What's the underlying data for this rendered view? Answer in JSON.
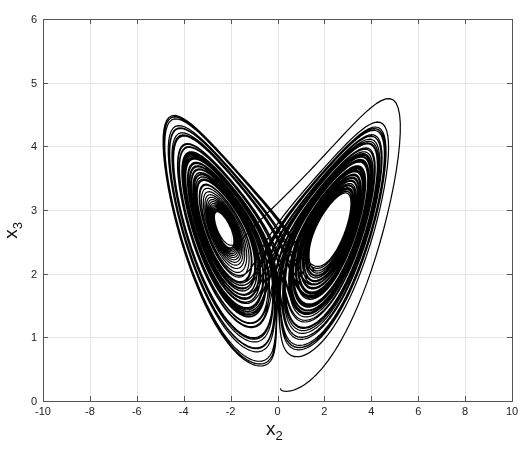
{
  "chart_data": {
    "type": "line",
    "title": "",
    "xlabel": "x",
    "xlabel_sub": "2",
    "ylabel": "x",
    "ylabel_sub": "3",
    "xlim": [
      -10,
      10
    ],
    "ylim": [
      0,
      6
    ],
    "xticks": [
      "-10",
      "-8",
      "-6",
      "-4",
      "-2",
      "0",
      "2",
      "4",
      "6",
      "8",
      "10"
    ],
    "yticks": [
      "0",
      "1",
      "2",
      "3",
      "4",
      "5",
      "6"
    ],
    "grid": true,
    "legend": null,
    "series": [
      {
        "name": "chaotic attractor trajectory (x2 vs x3)",
        "color": "#000000",
        "description": "Two-lobe chaotic attractor; lobes centered near (x2,x3)=(-2.3,2.6) and (2.3,2.6); outer envelope spans x2 from about -9 to 8.5 and x3 from about 0.2 to 5.6; cusp near x2=0 at bottom.",
        "lobe_centers": [
          [
            -2.3,
            2.6
          ],
          [
            2.3,
            2.6
          ]
        ],
        "extent": {
          "x2": [
            -9.0,
            8.5
          ],
          "x3": [
            0.2,
            5.6
          ]
        }
      }
    ]
  },
  "render": {
    "plot_box": {
      "left": 43,
      "top": 19,
      "right": 512,
      "bottom": 401
    },
    "grid_color": "#e6e6e6",
    "axis_color": "#555555",
    "line_color": "#000000",
    "system": {
      "sigma": 10,
      "rho": 28,
      "beta": 2.6667,
      "scale_x": 0.27,
      "scale_z": 0.1,
      "offset_z": 0.0,
      "dt": 0.006,
      "steps": 16000
    }
  }
}
